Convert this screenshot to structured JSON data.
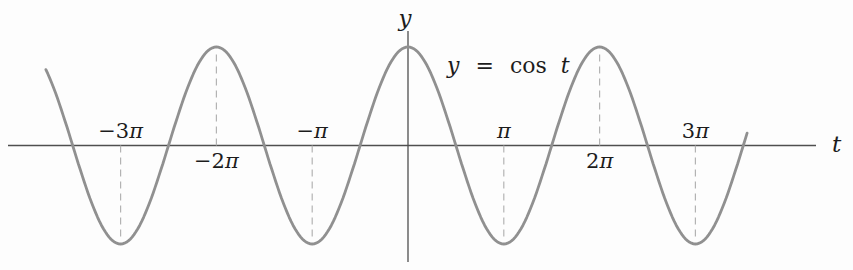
{
  "figure": {
    "equation_text": "y = cos t",
    "equation": {
      "lhs": "y",
      "relation": "=",
      "function": "cos",
      "argument": "t"
    },
    "x_axis_label": "t",
    "y_axis_label": "y"
  },
  "chart_data": {
    "type": "line",
    "expression": "y = cos t",
    "function": "cos",
    "variable": "t",
    "amplitude": 1,
    "period_in_pi": 2,
    "max": 1,
    "min": -1,
    "domain_in_pi": [
      -3.78,
      3.55
    ],
    "x_axis_range_in_pi": [
      -4.18,
      4.26
    ],
    "y_axis_range": [
      -1.18,
      1.16
    ],
    "grid": "off",
    "peaks_at_in_pi": [
      -2,
      0,
      2
    ],
    "troughs_at_in_pi": [
      -3,
      -1,
      1,
      3
    ],
    "x_ticks": [
      {
        "value_in_pi": -3,
        "label": "−3π",
        "prefix": "−3",
        "pi": "π",
        "label_side": "above",
        "guide_to": "trough"
      },
      {
        "value_in_pi": -2,
        "label": "−2π",
        "prefix": "−2",
        "pi": "π",
        "label_side": "below",
        "guide_to": "peak"
      },
      {
        "value_in_pi": -1,
        "label": "−π",
        "prefix": "−",
        "pi": "π",
        "label_side": "above",
        "guide_to": "trough"
      },
      {
        "value_in_pi": 1,
        "label": "π",
        "prefix": "",
        "pi": "π",
        "label_side": "above",
        "guide_to": "trough"
      },
      {
        "value_in_pi": 2,
        "label": "2π",
        "prefix": "2",
        "pi": "π",
        "label_side": "below",
        "guide_to": "peak"
      },
      {
        "value_in_pi": 3,
        "label": "3π",
        "prefix": "3",
        "pi": "π",
        "label_side": "above",
        "guide_to": "trough"
      }
    ]
  },
  "style": {
    "background": "#fdfdfd",
    "curve_color": "#909090",
    "axis_color": "#4f4f4f",
    "guide_color": "#b3b3b3",
    "text_color": "#1c1c1c"
  }
}
